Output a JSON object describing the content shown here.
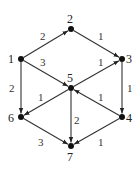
{
  "diagram": {
    "type": "directed-weighted-graph",
    "nodes": [
      {
        "id": "1",
        "label": "1",
        "x": 21,
        "y": 59,
        "lx": 8,
        "ly": 63
      },
      {
        "id": "2",
        "label": "2",
        "x": 71,
        "y": 29,
        "lx": 67,
        "ly": 23
      },
      {
        "id": "3",
        "label": "3",
        "x": 122,
        "y": 59,
        "lx": 126,
        "ly": 63
      },
      {
        "id": "4",
        "label": "4",
        "x": 122,
        "y": 117,
        "lx": 126,
        "ly": 122
      },
      {
        "id": "5",
        "label": "5",
        "x": 71,
        "y": 88,
        "lx": 67,
        "ly": 82
      },
      {
        "id": "6",
        "label": "6",
        "x": 21,
        "y": 117,
        "lx": 8,
        "ly": 122
      },
      {
        "id": "7",
        "label": "7",
        "x": 71,
        "y": 146,
        "lx": 67,
        "ly": 161
      }
    ],
    "edges": [
      {
        "from": "1",
        "to": "2",
        "weight": "2",
        "wx": 40,
        "wy": 40
      },
      {
        "from": "2",
        "to": "3",
        "weight": "1",
        "wx": 98,
        "wy": 40
      },
      {
        "from": "1",
        "to": "5",
        "weight": "3",
        "wx": 40,
        "wy": 66
      },
      {
        "from": "5",
        "to": "3",
        "weight": "1",
        "wx": 98,
        "wy": 66
      },
      {
        "from": "1",
        "to": "6",
        "weight": "2",
        "wx": 9,
        "wy": 92
      },
      {
        "from": "3",
        "to": "4",
        "weight": "1",
        "wx": 127,
        "wy": 92
      },
      {
        "from": "5",
        "to": "6",
        "weight": "1",
        "wx": 38,
        "wy": 101
      },
      {
        "from": "4",
        "to": "5",
        "weight": "1",
        "wx": 98,
        "wy": 101
      },
      {
        "from": "5",
        "to": "7",
        "weight": "2",
        "wx": 74,
        "wy": 124
      },
      {
        "from": "6",
        "to": "7",
        "weight": "3",
        "wx": 38,
        "wy": 146
      },
      {
        "from": "4",
        "to": "7",
        "weight": "1",
        "wx": 98,
        "wy": 146
      }
    ]
  }
}
